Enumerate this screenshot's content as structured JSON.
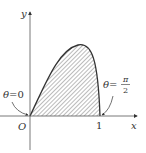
{
  "diagram": {
    "axes": {
      "x_label": "x",
      "y_label": "y",
      "origin_label": "O",
      "x_tick_label": "1"
    },
    "annotations": {
      "start": {
        "theta": "θ",
        "eq": "=",
        "value": "0"
      },
      "end": {
        "theta": "θ",
        "eq": "=",
        "numerator": "π",
        "denominator": "2"
      }
    },
    "region": {
      "fill": "hatched",
      "description": "area under parametric curve between x=0 and x=1"
    },
    "colors": {
      "stroke": "#333333",
      "hatch": "#555555",
      "background": "#ffffff"
    }
  }
}
